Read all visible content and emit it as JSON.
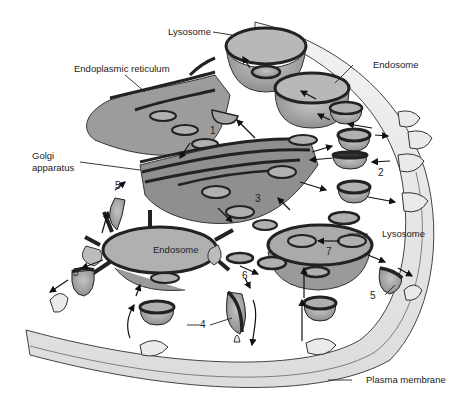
{
  "diagram": {
    "type": "cell-biology-illustration",
    "labels": {
      "lysosome_top": "Lysosome",
      "endoplasmic_reticulum": "Endoplasmic reticulum",
      "endosome_top": "Endosome",
      "golgi_line1": "Golgi",
      "golgi_line2": "apparatus",
      "endosome_center": "Endosome",
      "lysosome_right": "Lysosome",
      "plasma_membrane": "Plasma membrane"
    },
    "step_numbers": {
      "n1": "1",
      "n2": "2",
      "n3": "3",
      "n4": "4",
      "n5a": "5",
      "n5b": "5",
      "n5c": "5",
      "n6": "6",
      "n7": "7"
    },
    "colors": {
      "organelle_fill": "#a9a9a9",
      "organelle_dark": "#8a8a8a",
      "membrane_outline": "#2a2a2a",
      "cytoplasm_band": "#e8e8e8",
      "background": "#ffffff"
    }
  }
}
